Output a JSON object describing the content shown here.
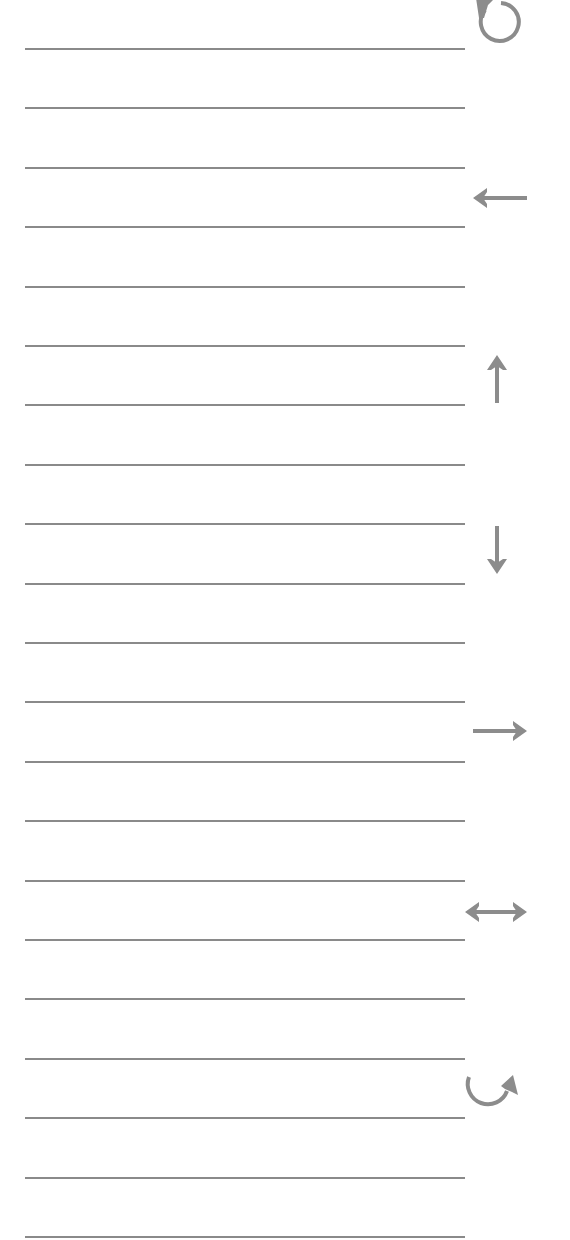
{
  "sheet": {
    "background": "#ffffff",
    "line_color": "#8a8a8a",
    "icon_color": "#8c8c8c",
    "line_count": 21,
    "first_line_y": 49,
    "line_pitch": 59.4,
    "line_left": 25,
    "line_width": 440
  },
  "icons": [
    {
      "name": "rotate-counterclockwise-icon",
      "cx": 490,
      "cy": 18
    },
    {
      "name": "arrow-left-icon",
      "cx": 500,
      "cy": 198
    },
    {
      "name": "arrow-up-icon",
      "cx": 497,
      "cy": 383
    },
    {
      "name": "arrow-down-icon",
      "cx": 497,
      "cy": 550
    },
    {
      "name": "arrow-right-icon",
      "cx": 500,
      "cy": 731
    },
    {
      "name": "arrow-left-right-icon",
      "cx": 496,
      "cy": 912
    },
    {
      "name": "curved-arrow-clockwise-icon",
      "cx": 496,
      "cy": 1085
    }
  ]
}
